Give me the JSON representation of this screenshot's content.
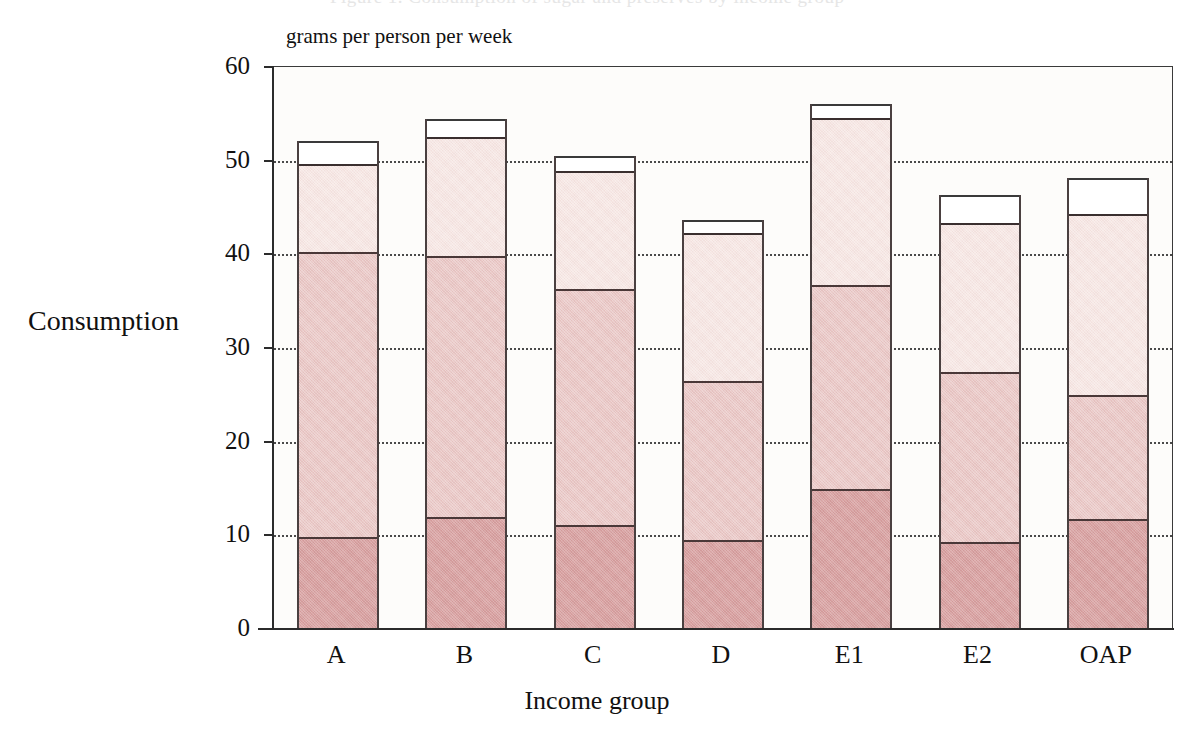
{
  "figure": {
    "top_cut_ghost": "Figure 1. Consumption of sugar and preserves by income group",
    "units_caption": "grams per person per week",
    "y_axis_title": "Consumption",
    "x_axis_title": "Income group"
  },
  "chart_data": {
    "type": "bar",
    "subtype": "stacked-bar",
    "title": "",
    "xlabel": "Income group",
    "ylabel": "Consumption",
    "units": "grams per person per week",
    "categories": [
      "A",
      "B",
      "C",
      "D",
      "E1",
      "E2",
      "OAP"
    ],
    "ylim": [
      0,
      60
    ],
    "yticks": [
      0,
      10,
      20,
      30,
      40,
      50,
      60
    ],
    "ytick_labels": [
      "0",
      "10",
      "20",
      "30",
      "40",
      "50",
      "60"
    ],
    "grid": "horizontal-dotted",
    "gridlines_at": [
      10,
      20,
      30,
      40,
      50
    ],
    "legend": "none",
    "series": [
      {
        "name": "segment-1-bottom",
        "color": "#d9a2a2",
        "values": [
          9.8,
          12.0,
          11.1,
          9.5,
          14.9,
          9.3,
          11.7
        ]
      },
      {
        "name": "segment-2",
        "color": "#eac8c6",
        "values": [
          30.4,
          27.8,
          25.2,
          17.0,
          21.8,
          18.1,
          13.3
        ]
      },
      {
        "name": "segment-3",
        "color": "#f6e6e3",
        "values": [
          9.4,
          12.7,
          12.6,
          15.8,
          17.9,
          16.0,
          19.3
        ]
      },
      {
        "name": "segment-4-top",
        "color": "#ffffff",
        "values": [
          2.5,
          2.0,
          1.6,
          1.4,
          1.4,
          2.9,
          3.9
        ]
      }
    ],
    "cumulative_tops": {
      "segment-1-bottom": [
        9.8,
        12.0,
        11.1,
        9.5,
        14.9,
        9.3,
        11.7
      ],
      "segment-2": [
        40.2,
        39.8,
        36.3,
        26.5,
        36.7,
        27.4,
        25.0
      ],
      "segment-3": [
        49.6,
        52.5,
        48.9,
        42.3,
        54.6,
        43.4,
        44.3
      ],
      "segment-4-top": [
        52.1,
        54.5,
        50.5,
        43.7,
        56.0,
        46.3,
        48.2
      ]
    },
    "totals": [
      52.1,
      54.5,
      50.5,
      43.7,
      56.0,
      46.3,
      48.2
    ]
  }
}
